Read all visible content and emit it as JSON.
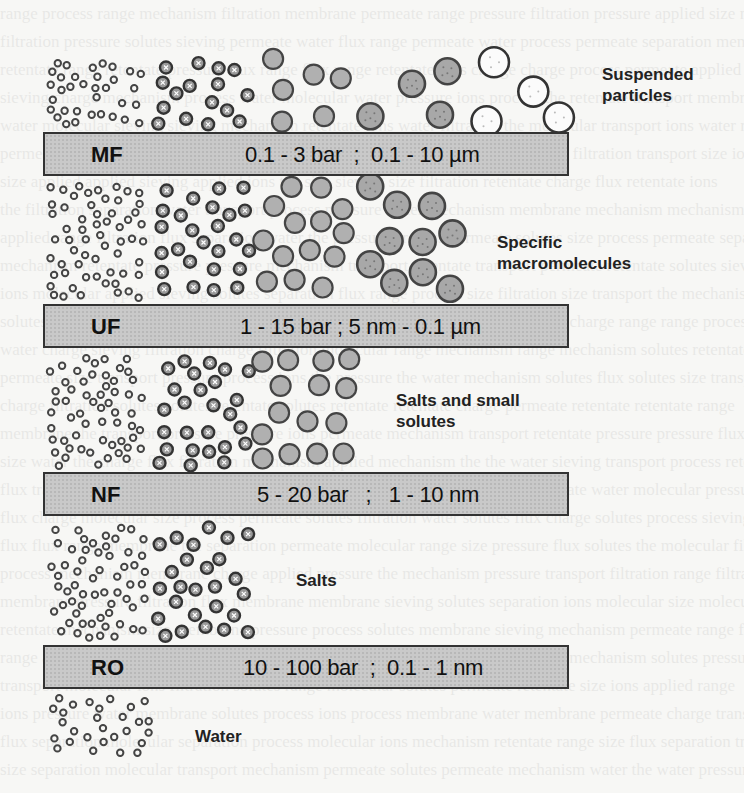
{
  "figure": {
    "processes": [
      {
        "code": "MF",
        "range": "0.1 - 3 bar  ;  0.1 - 10 µm",
        "retained": "Suspended particles",
        "pressure": "0.1 - 3 bar",
        "pore_size": "0.1 - 10 µm"
      },
      {
        "code": "UF",
        "range": "1 - 15 bar ; 5 nm - 0.1 µm",
        "retained": "Specific macromolecules",
        "pressure": "1 - 15 bar",
        "pore_size": "5 nm - 0.1 µm"
      },
      {
        "code": "NF",
        "range": "5 - 20 bar   ;   1 - 10 nm",
        "retained": "Salts and small solutes",
        "pressure": "5 - 20 bar",
        "pore_size": "1 - 10 nm"
      },
      {
        "code": "RO",
        "range": "10 - 100 bar  ;  0.1 - 1 nm",
        "retained": "Salts",
        "pressure": "10 - 100 bar",
        "pore_size": "0.1 - 1 nm"
      }
    ],
    "labels": {
      "suspended_line1": "Suspended",
      "suspended_line2": "particles",
      "macro_line1": "Specific",
      "macro_line2": "macromolecules",
      "salts_small_line1": "Salts and small",
      "salts_small_line2": "solutes",
      "salts": "Salts",
      "water": "Water"
    },
    "particle_types": [
      "water",
      "salts",
      "small-solutes",
      "macromolecules",
      "suspended-particles"
    ]
  }
}
